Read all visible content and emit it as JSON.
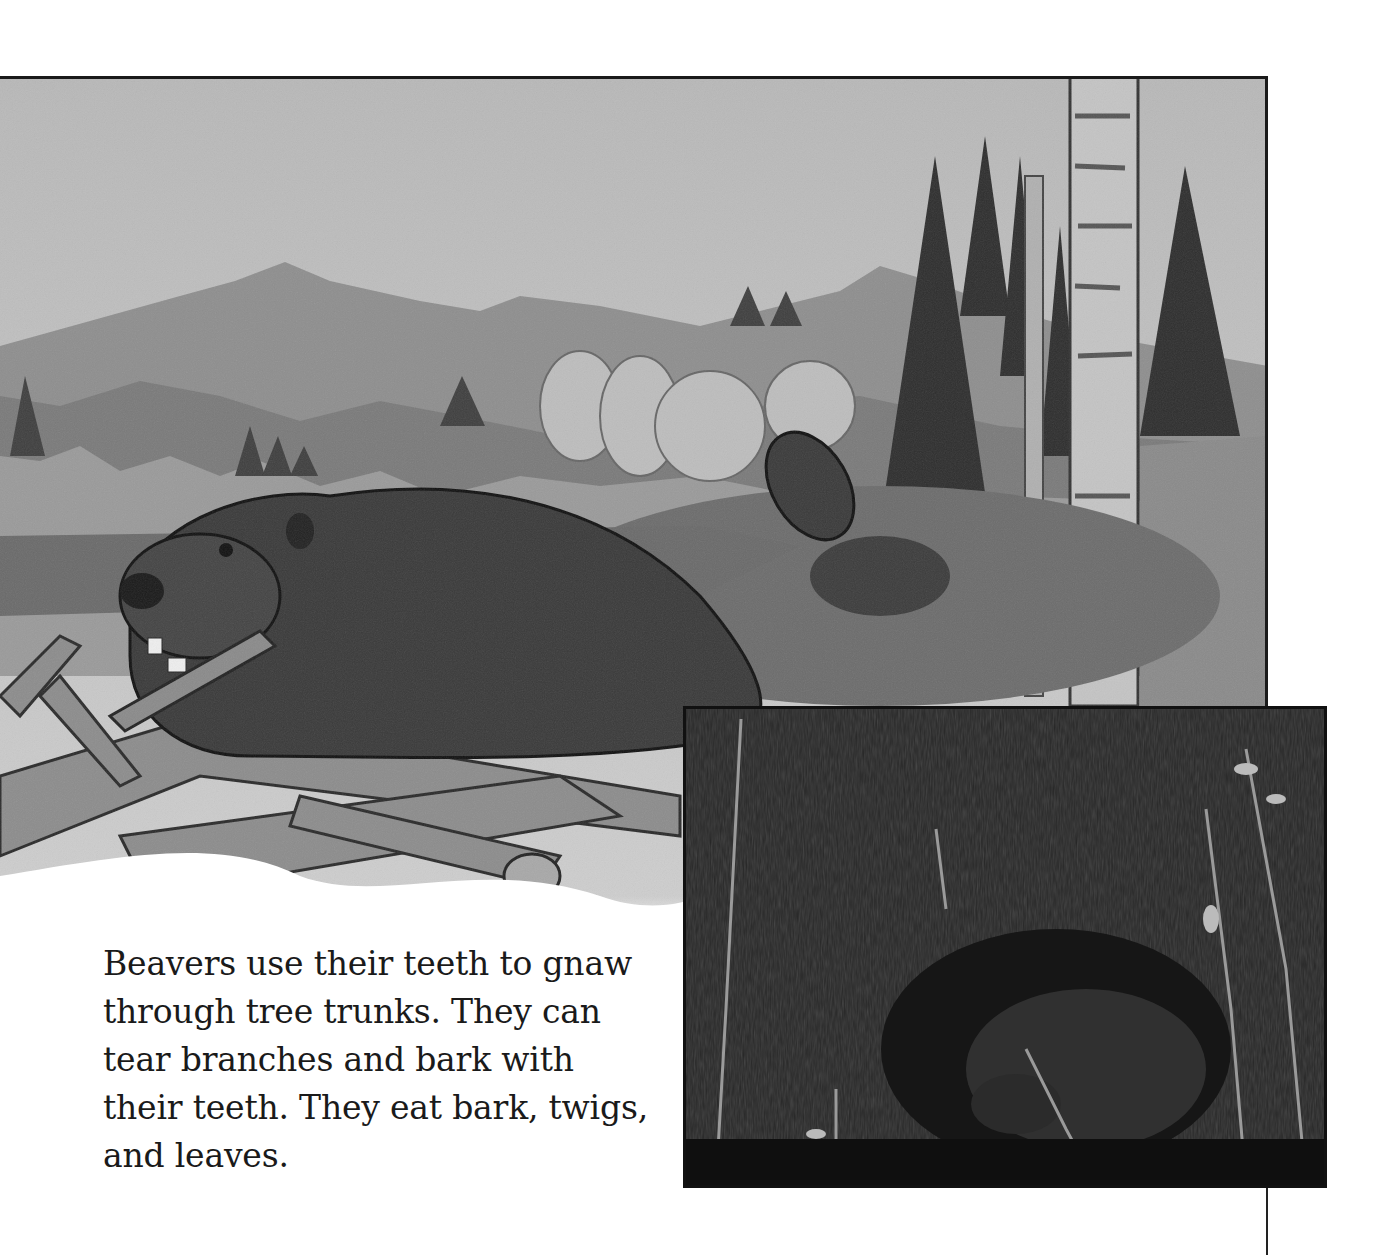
{
  "page": {
    "background": "#ffffff"
  },
  "illustration": {
    "subject": "Painted grayscale scene: a beaver gnawing a branch atop a lodge of logs, a second beaver diving into a pond, mountains, pine trees and birch trunks",
    "style": "grayscale watercolor/pencil"
  },
  "inset_photo": {
    "subject": "Photograph of a beaver in dark water among thin reeds and branches",
    "border_color": "#111111"
  },
  "body_text": {
    "lines": [
      "Beavers use their teeth to gnaw",
      "through tree trunks. They can",
      "tear branches and bark with",
      "their teeth. They eat bark, twigs,",
      "and leaves."
    ]
  }
}
